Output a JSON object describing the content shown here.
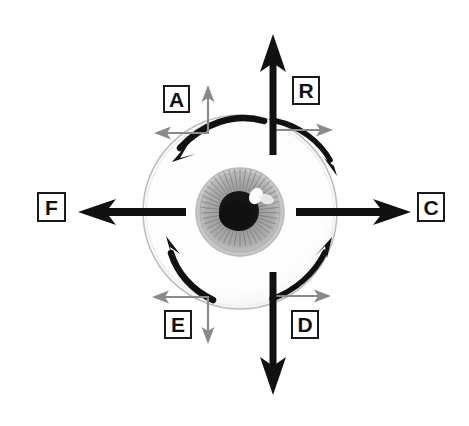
{
  "diagram": {
    "type": "anatomical-vector-diagram",
    "background_color": "#ffffff"
  },
  "eye": {
    "name": "eyeball",
    "sclera_color": "#ffffff",
    "sclera_outline_color": "#b8b8b8",
    "iris_color": "#9a9a9a",
    "iris_detail_color": "#6e6e6e",
    "pupil_color": "#111111",
    "highlight_color": "#ffffff",
    "center_x": 240,
    "center_y": 212,
    "sclera_radius": 97,
    "iris_radius": 44,
    "pupil_radius": 20
  },
  "colors": {
    "primary_arrow": "#111111",
    "secondary_arrow": "#8a8a8a",
    "box_border": "#1a1a1a",
    "text": "#111111"
  },
  "labels": [
    {
      "id": "A",
      "text": "A",
      "position": "top-left",
      "arrow_style": "thin-gray",
      "directions": [
        "up",
        "left"
      ]
    },
    {
      "id": "R",
      "text": "R",
      "position": "top-right",
      "arrow_style": "thick-black",
      "directions": [
        "up",
        "right"
      ]
    },
    {
      "id": "F",
      "text": "F",
      "position": "left",
      "arrow_style": "thick-black",
      "directions": [
        "left"
      ]
    },
    {
      "id": "C",
      "text": "C",
      "position": "right",
      "arrow_style": "thick-black",
      "directions": [
        "right"
      ]
    },
    {
      "id": "E",
      "text": "E",
      "position": "bottom-left",
      "arrow_style": "thin-gray",
      "directions": [
        "left",
        "down"
      ]
    },
    {
      "id": "D",
      "text": "D",
      "position": "bottom-right",
      "arrow_style": "thick-black",
      "directions": [
        "down",
        "right"
      ]
    }
  ],
  "straight_arrows": [
    {
      "name": "up-arrow-R",
      "color": "#111111",
      "weight": "thick",
      "direction": "up",
      "from": [
        273,
        152
      ],
      "to": [
        273,
        36
      ]
    },
    {
      "name": "right-arrow-C",
      "color": "#111111",
      "weight": "thick",
      "direction": "right",
      "from": [
        296,
        212
      ],
      "to": [
        410,
        212
      ]
    },
    {
      "name": "down-arrow-D",
      "color": "#111111",
      "weight": "thick",
      "direction": "down",
      "from": [
        273,
        272
      ],
      "to": [
        273,
        394
      ]
    },
    {
      "name": "left-arrow-F",
      "color": "#111111",
      "weight": "thick",
      "direction": "left",
      "from": [
        186,
        212
      ],
      "to": [
        78,
        212
      ]
    }
  ],
  "thin_arrows": [
    {
      "name": "thin-up-arrow-A",
      "color": "#8a8a8a",
      "direction": "up",
      "from": [
        208,
        133
      ],
      "to": [
        208,
        86
      ]
    },
    {
      "name": "thin-left-arrow-A",
      "color": "#8a8a8a",
      "direction": "left",
      "from": [
        208,
        133
      ],
      "to": [
        155,
        133
      ]
    },
    {
      "name": "thin-right-arrow-R",
      "color": "#8a8a8a",
      "direction": "right",
      "from": [
        273,
        130
      ],
      "to": [
        332,
        130
      ]
    },
    {
      "name": "thin-left-arrow-E",
      "color": "#8a8a8a",
      "direction": "left",
      "from": [
        208,
        297
      ],
      "to": [
        152,
        297
      ]
    },
    {
      "name": "thin-down-arrow-E",
      "color": "#8a8a8a",
      "direction": "down",
      "from": [
        208,
        297
      ],
      "to": [
        208,
        344
      ]
    },
    {
      "name": "thin-right-arrow-D",
      "color": "#8a8a8a",
      "direction": "right",
      "from": [
        273,
        296
      ],
      "to": [
        331,
        296
      ]
    }
  ],
  "curved_arrows": [
    {
      "name": "curved-arrow-top-left",
      "color": "#111111",
      "rotation": "counterclockwise",
      "from_angle": 270,
      "to_angle": 195
    },
    {
      "name": "curved-arrow-top-right",
      "color": "#111111",
      "rotation": "clockwise",
      "from_angle": 270,
      "to_angle": 345
    },
    {
      "name": "curved-arrow-bottom-left",
      "color": "#111111",
      "rotation": "clockwise",
      "from_angle": 90,
      "to_angle": 165
    },
    {
      "name": "curved-arrow-bottom-right",
      "color": "#111111",
      "rotation": "counterclockwise",
      "from_angle": 90,
      "to_angle": 15
    }
  ]
}
